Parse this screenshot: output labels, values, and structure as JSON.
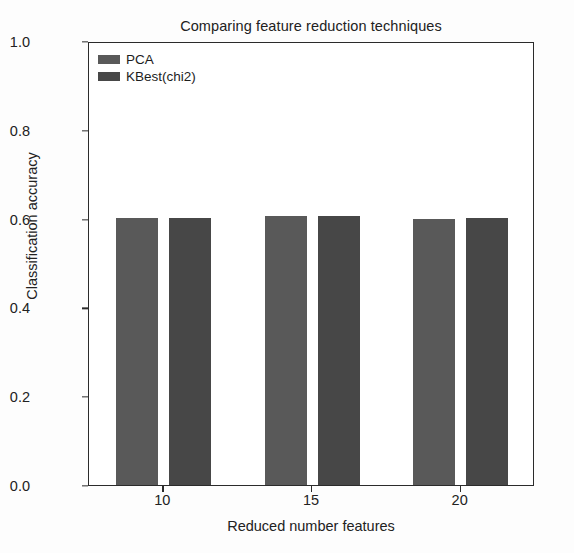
{
  "chart_data": {
    "type": "bar",
    "title": "Comparing feature reduction techniques",
    "xlabel": "Reduced number features",
    "ylabel": "Classification accuracy",
    "categories": [
      "10",
      "15",
      "20"
    ],
    "series": [
      {
        "name": "PCA",
        "color": "#595959",
        "values": [
          0.601,
          0.606,
          0.6
        ]
      },
      {
        "name": "KBest(chi2)",
        "color": "#474747",
        "values": [
          0.601,
          0.605,
          0.601
        ]
      }
    ],
    "ylim": [
      0.0,
      1.0
    ],
    "yticks": [
      "0.0",
      "0.2",
      "0.4",
      "0.6",
      "0.8",
      "1.0"
    ],
    "ytick_values": [
      0.0,
      0.2,
      0.4,
      0.6,
      0.8,
      1.0
    ],
    "xticks": [
      "10",
      "15",
      "20"
    ],
    "grid": false,
    "legend_position": "upper left",
    "background_color": "#ffffff",
    "axis_color": "#2b2b2b"
  }
}
